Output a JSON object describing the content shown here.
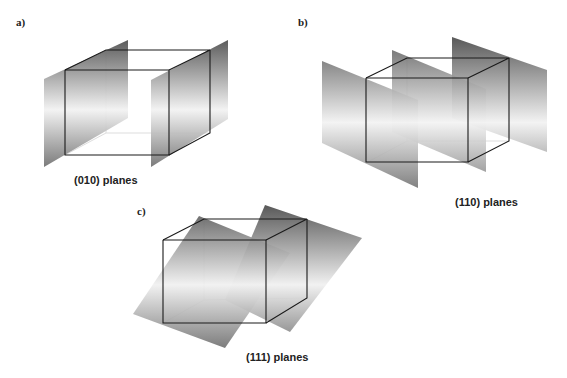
{
  "figure": {
    "panels": [
      {
        "id": "a",
        "label": "a)",
        "caption": "(010) planes"
      },
      {
        "id": "b",
        "label": "b)",
        "caption": "(110) planes"
      },
      {
        "id": "c",
        "label": "c)",
        "caption": "(111) planes"
      }
    ]
  },
  "colors": {
    "plane_dark": "#5a5a5a",
    "plane_light": "#f0f0f0",
    "cube_edge": "#1a1a1a",
    "hidden_edge": "#d8d8d8"
  }
}
